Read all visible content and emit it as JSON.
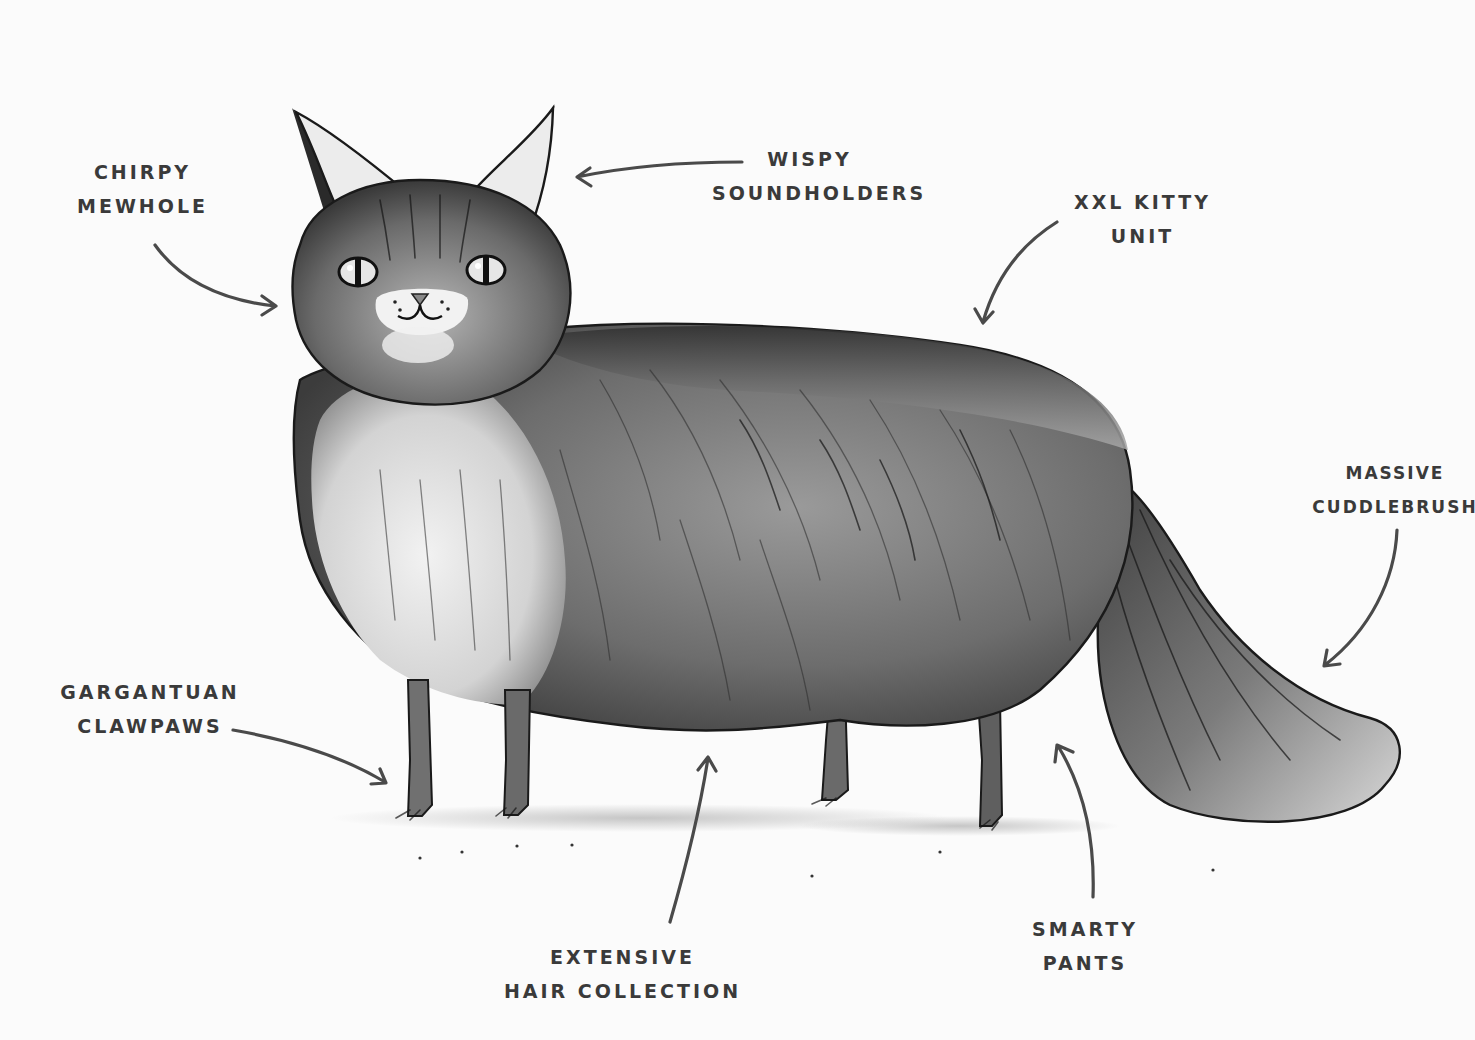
{
  "diagram": {
    "background_color": "#fbfbfb",
    "ink_color": "#3a3a3a",
    "labels": [
      {
        "id": "chirpy-mewhole",
        "lines": [
          "Chirpy",
          "Mewhole"
        ],
        "points_to": "mouth"
      },
      {
        "id": "wispy-soundholders",
        "lines": [
          "Wispy",
          "Soundholders"
        ],
        "points_to": "ears"
      },
      {
        "id": "xxl-kitty-unit",
        "lines": [
          "XXL Kitty",
          "Unit"
        ],
        "points_to": "back"
      },
      {
        "id": "massive-cuddlebrush",
        "lines": [
          "Massive",
          "Cuddlebrush"
        ],
        "points_to": "tail"
      },
      {
        "id": "gargantuan-clawpaws",
        "lines": [
          "Gargantuan",
          "Clawpaws"
        ],
        "points_to": "front-paws"
      },
      {
        "id": "extensive-hair-collection",
        "lines": [
          "Extensive",
          "Hair Collection"
        ],
        "points_to": "belly-fur"
      },
      {
        "id": "smarty-pants",
        "lines": [
          "Smarty",
          "Pants"
        ],
        "points_to": "hind-legs"
      }
    ]
  }
}
